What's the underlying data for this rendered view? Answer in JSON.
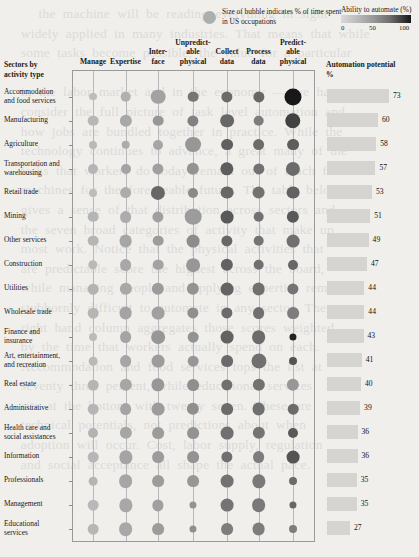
{
  "legend": {
    "bubble_icon": "bubble-legend-icon",
    "bubble_note": "Size of bubble indicates % of time spent in US occupations",
    "gradient_title": "Ability to automate (%)",
    "scale_min": "0",
    "scale_mid": "50",
    "scale_max": "100",
    "gradient_low_color": "#d9d9d9",
    "gradient_high_color": "#161616"
  },
  "headers": {
    "row_axis_title": "Sectors by activity type",
    "bar_axis_title": "Automation potential %"
  },
  "chart_data": {
    "type": "bubble",
    "title": "Sectors by activity type",
    "xlabel": "",
    "ylabel": "",
    "categories": [
      "Manage",
      "Expertise",
      "Inter- face",
      "Unpredict- able physical",
      "Collect data",
      "Process data",
      "Predict- able physical"
    ],
    "category_lines": [
      [
        "Manage"
      ],
      [
        "Expertise"
      ],
      [
        "Inter-",
        "face"
      ],
      [
        "Unpredict-",
        "able",
        "physical"
      ],
      [
        "Collect",
        "data"
      ],
      [
        "Process",
        "data"
      ],
      [
        "Predict-",
        "able",
        "physical"
      ]
    ],
    "sectors": [
      "Accommodation and food services",
      "Manufacturing",
      "Agriculture",
      "Transportation and warehousing",
      "Retail trade",
      "Mining",
      "Other services",
      "Construction",
      "Utilities",
      "Wholesale trade",
      "Finance and insurance",
      "Art, entertainment, and recreation",
      "Real estate",
      "Administrative",
      "Health care and social assistances",
      "Information",
      "Professionals",
      "Management",
      "Educational services"
    ],
    "sector_lines": [
      [
        "Accommodation",
        "and food services"
      ],
      [
        "Manufacturing"
      ],
      [
        "Agriculture"
      ],
      [
        "Transportation and",
        "warehousing"
      ],
      [
        "Retail trade"
      ],
      [
        "Mining"
      ],
      [
        "Other services"
      ],
      [
        "Construction"
      ],
      [
        "Utilities"
      ],
      [
        "Wholesale trade"
      ],
      [
        "Finance and",
        "insurance"
      ],
      [
        "Art, entertainment,",
        "and recreation"
      ],
      [
        "Real estate"
      ],
      [
        "Administrative"
      ],
      [
        "Health care and",
        "social assistances"
      ],
      [
        "Information"
      ],
      [
        "Professionals"
      ],
      [
        "Management"
      ],
      [
        "Educational",
        "services"
      ]
    ],
    "automation_potential": [
      73,
      60,
      58,
      57,
      53,
      51,
      49,
      47,
      44,
      44,
      43,
      41,
      40,
      39,
      36,
      36,
      35,
      35,
      27
    ],
    "bubble_size_note": "size = % of time spent in US occupations",
    "bubble_color_note": "darkness = ability to automate (%)",
    "size_values": [
      [
        5,
        9,
        17,
        9,
        10,
        10,
        23
      ],
      [
        9,
        12,
        9,
        10,
        15,
        9,
        19
      ],
      [
        5,
        6,
        8,
        20,
        11,
        11,
        11
      ],
      [
        8,
        8,
        10,
        12,
        14,
        10,
        16
      ],
      [
        5,
        11,
        16,
        8,
        13,
        13,
        13
      ],
      [
        9,
        11,
        10,
        22,
        13,
        9,
        12
      ],
      [
        9,
        13,
        9,
        13,
        10,
        9,
        13
      ],
      [
        7,
        11,
        9,
        15,
        12,
        9,
        8
      ],
      [
        9,
        12,
        12,
        12,
        13,
        13,
        10
      ],
      [
        9,
        13,
        13,
        10,
        10,
        11,
        11
      ],
      [
        5,
        11,
        15,
        9,
        13,
        15,
        4
      ],
      [
        6,
        11,
        13,
        9,
        11,
        18,
        5
      ],
      [
        9,
        12,
        14,
        11,
        10,
        12,
        12
      ],
      [
        9,
        11,
        13,
        12,
        11,
        13,
        9
      ],
      [
        8,
        12,
        11,
        11,
        13,
        12,
        8
      ],
      [
        9,
        14,
        11,
        11,
        10,
        11,
        13
      ],
      [
        6,
        15,
        11,
        11,
        13,
        14,
        5
      ],
      [
        9,
        14,
        10,
        4,
        13,
        15,
        4
      ],
      [
        9,
        15,
        11,
        4,
        11,
        13,
        5
      ]
    ],
    "automatability_values": [
      [
        22,
        28,
        35,
        55,
        60,
        62,
        95
      ],
      [
        25,
        32,
        40,
        50,
        62,
        52,
        78
      ],
      [
        24,
        30,
        33,
        40,
        65,
        60,
        66
      ],
      [
        26,
        34,
        36,
        42,
        66,
        57,
        60
      ],
      [
        22,
        30,
        62,
        46,
        62,
        57,
        64
      ],
      [
        26,
        30,
        36,
        38,
        68,
        57,
        68
      ],
      [
        26,
        33,
        38,
        45,
        62,
        56,
        58
      ],
      [
        24,
        32,
        35,
        40,
        64,
        58,
        62
      ],
      [
        27,
        32,
        38,
        42,
        63,
        58,
        56
      ],
      [
        26,
        34,
        36,
        44,
        60,
        58,
        52
      ],
      [
        23,
        34,
        40,
        42,
        64,
        60,
        90
      ],
      [
        24,
        33,
        38,
        40,
        60,
        58,
        70
      ],
      [
        26,
        33,
        40,
        44,
        58,
        57,
        40
      ],
      [
        26,
        34,
        38,
        44,
        60,
        58,
        60
      ],
      [
        27,
        33,
        38,
        42,
        58,
        56,
        68
      ],
      [
        25,
        34,
        38,
        42,
        58,
        52,
        70
      ],
      [
        26,
        33,
        38,
        40,
        57,
        54,
        60
      ],
      [
        24,
        32,
        36,
        42,
        56,
        54,
        62
      ],
      [
        25,
        32,
        38,
        44,
        52,
        52,
        52
      ]
    ],
    "grid": false,
    "legend_position": "top"
  }
}
